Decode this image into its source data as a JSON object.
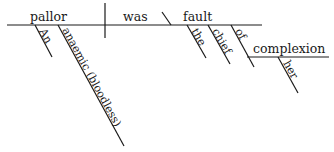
{
  "diagram": {
    "type": "sentence-diagram",
    "sentence": "An anaemic (bloodless) pallor was the chief fault of her complexion",
    "subject": "pallor",
    "verb": "was",
    "predicate_nominative": "fault",
    "complement": "complexion",
    "modifiers": {
      "subject_mod_1": "An",
      "subject_mod_2": "anaemic (bloodless)",
      "pred_mod_1": "the",
      "pred_mod_2": "chief",
      "preposition": "of",
      "object_mod": "her"
    },
    "colors": {
      "ink": "#1a1a1a",
      "background": "#ffffff"
    }
  }
}
